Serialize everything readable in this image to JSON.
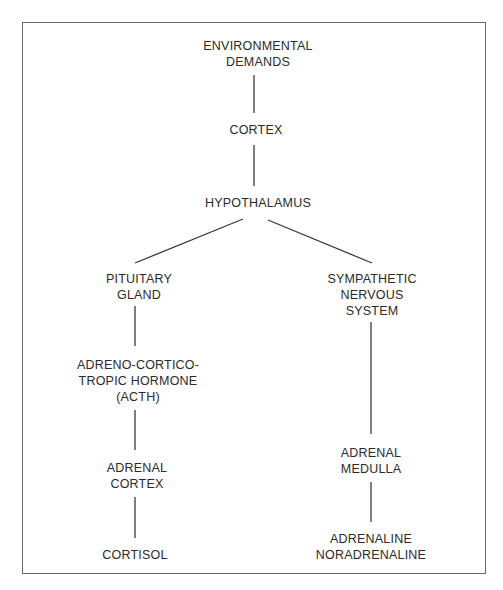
{
  "diagram": {
    "type": "flowchart",
    "title": "",
    "nodes": [
      {
        "id": "env",
        "lines": [
          "ENVIRONMENTAL",
          "DEMANDS"
        ]
      },
      {
        "id": "cortex",
        "lines": [
          "CORTEX"
        ]
      },
      {
        "id": "hypo",
        "lines": [
          "HYPOTHALAMUS"
        ]
      },
      {
        "id": "pituitary",
        "lines": [
          "PITUITARY",
          "GLAND"
        ]
      },
      {
        "id": "sympathetic",
        "lines": [
          "SYMPATHETIC",
          "NERVOUS",
          "SYSTEM"
        ]
      },
      {
        "id": "acth",
        "lines": [
          "ADRENO-CORTICO-",
          "TROPIC HORMONE",
          "(ACTH)"
        ]
      },
      {
        "id": "adrenal_cortex",
        "lines": [
          "ADRENAL",
          "CORTEX"
        ]
      },
      {
        "id": "cortisol",
        "lines": [
          "CORTISOL"
        ]
      },
      {
        "id": "adrenal_medulla",
        "lines": [
          "ADRENAL",
          "MEDULLA"
        ]
      },
      {
        "id": "catecholamines",
        "lines": [
          "ADRENALINE",
          "NORADRENALINE"
        ]
      }
    ],
    "edges": [
      {
        "from": "env",
        "to": "cortex"
      },
      {
        "from": "cortex",
        "to": "hypo"
      },
      {
        "from": "hypo",
        "to": "pituitary"
      },
      {
        "from": "hypo",
        "to": "sympathetic"
      },
      {
        "from": "pituitary",
        "to": "acth"
      },
      {
        "from": "acth",
        "to": "adrenal_cortex"
      },
      {
        "from": "adrenal_cortex",
        "to": "cortisol"
      },
      {
        "from": "sympathetic",
        "to": "adrenal_medulla"
      },
      {
        "from": "adrenal_medulla",
        "to": "catecholamines"
      }
    ]
  }
}
